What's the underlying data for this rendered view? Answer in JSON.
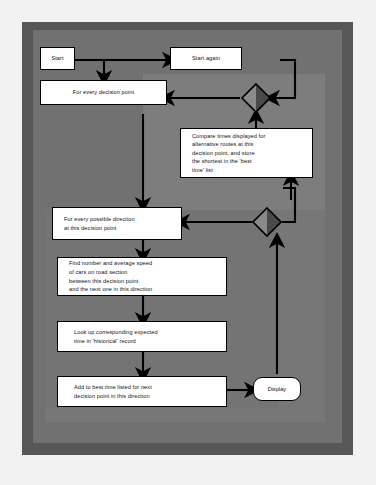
{
  "diagram": {
    "type": "flowchart",
    "colors": {
      "page_background": "#f2f2f2",
      "frame_outer": "#575757",
      "frame_mid": "#717171",
      "panel_light": "#7d7d7d",
      "node_fill": "#ffffff",
      "node_stroke": "#000000",
      "diamond_light": "#8a8a8a",
      "diamond_dark": "#4a4a4a"
    },
    "nodes": [
      {
        "id": "start",
        "shape": "process",
        "label": "Start"
      },
      {
        "id": "start-again",
        "shape": "process",
        "label": "Start again"
      },
      {
        "id": "every-decision-point",
        "shape": "process",
        "label": "For every decision point"
      },
      {
        "id": "compare-times",
        "shape": "process",
        "label": "Compare times displayed for\nalternative routes at this\ndecision point, and store\nthe shortest in the 'best\ntime' list"
      },
      {
        "id": "every-direction",
        "shape": "process",
        "label": "For every possible direction\nat this decision point"
      },
      {
        "id": "find-number-speed",
        "shape": "process",
        "label": "Find number and average speed\nof cars on road section\nbetween this decision point\nand the next one in this direction"
      },
      {
        "id": "look-up-expected-time",
        "shape": "process",
        "label": "Look up corresponding expected\ntime in 'historical' record"
      },
      {
        "id": "add-to-best-time",
        "shape": "process",
        "label": "Add to best time listed for next\ndecision point in this direction"
      },
      {
        "id": "display",
        "shape": "terminator",
        "label": "Display"
      },
      {
        "id": "decision-upper",
        "shape": "decision",
        "label": ""
      },
      {
        "id": "decision-lower",
        "shape": "decision",
        "label": ""
      }
    ],
    "edges": [
      {
        "from": "start",
        "to": "every-decision-point"
      },
      {
        "from": "start",
        "to": "start-again"
      },
      {
        "from": "decision-upper",
        "to": "every-decision-point"
      },
      {
        "from": "start-again",
        "to": "decision-upper"
      },
      {
        "from": "compare-times",
        "to": "decision-upper"
      },
      {
        "from": "every-decision-point",
        "to": "every-direction"
      },
      {
        "from": "decision-lower",
        "to": "every-direction"
      },
      {
        "from": "decision-lower",
        "to": "compare-times"
      },
      {
        "from": "every-direction",
        "to": "find-number-speed"
      },
      {
        "from": "find-number-speed",
        "to": "look-up-expected-time"
      },
      {
        "from": "look-up-expected-time",
        "to": "add-to-best-time"
      },
      {
        "from": "add-to-best-time",
        "to": "display"
      },
      {
        "from": "display",
        "to": "decision-lower"
      }
    ]
  }
}
